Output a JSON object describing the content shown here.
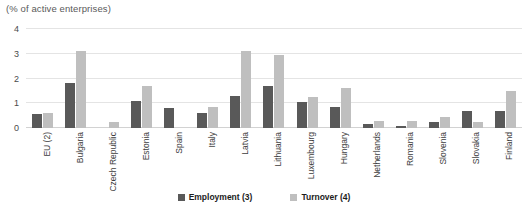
{
  "chart_data": {
    "type": "bar",
    "title": "(% of active enterprises)",
    "subtitle": "(% of active enterprises)",
    "xlabel": "",
    "ylabel": "",
    "ylim": [
      0,
      4
    ],
    "yticks": [
      0,
      1,
      2,
      3,
      4
    ],
    "ytick_labels": [
      "0",
      "1",
      "2",
      "3",
      "4"
    ],
    "grid": true,
    "legend_position": "bottom-center",
    "categories": [
      "EU (2)",
      "Bulgaria",
      "Czech Republic",
      "Estonia",
      "Spain",
      "Italy",
      "Latvia",
      "Lithuania",
      "Luxembourg",
      "Hungary",
      "Netherlands",
      "Romania",
      "Slovenia",
      "Slovakia",
      "Finland"
    ],
    "series": [
      {
        "name": "Employment (3)",
        "color": "#595959",
        "values": [
          0.55,
          1.8,
          null,
          1.1,
          0.8,
          0.6,
          1.3,
          1.7,
          1.05,
          0.85,
          0.15,
          0.1,
          0.25,
          0.7,
          0.7
        ]
      },
      {
        "name": "Turnover (4)",
        "color": "#bfbfbf",
        "values": [
          0.6,
          3.1,
          0.25,
          1.7,
          null,
          0.85,
          3.1,
          2.95,
          1.25,
          1.6,
          0.3,
          0.3,
          0.45,
          0.25,
          1.5
        ]
      }
    ]
  },
  "legend": {
    "items": [
      {
        "label": "Employment (3)"
      },
      {
        "label": "Turnover (4)"
      }
    ]
  }
}
